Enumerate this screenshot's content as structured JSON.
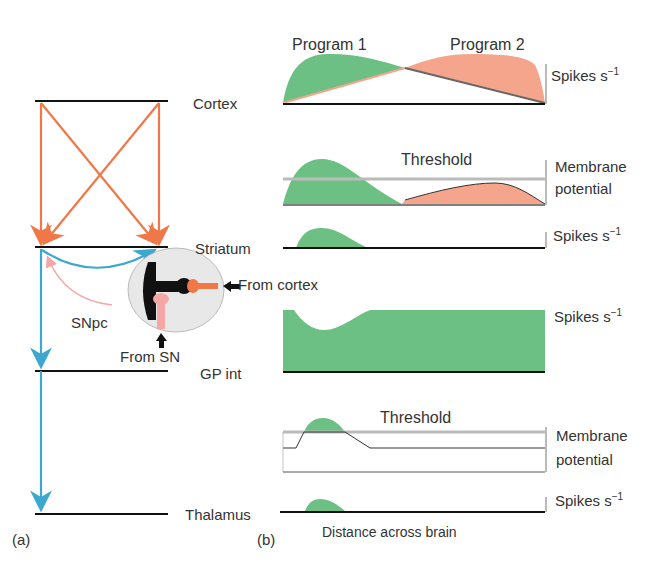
{
  "panel_a": {
    "label": "(a)",
    "levels": [
      "Cortex",
      "Striatum",
      "GP int",
      "Thalamus"
    ],
    "inset": {
      "from_cortex": "From cortex",
      "from_sn": "From SN",
      "snpc": "SNpc"
    }
  },
  "panel_b": {
    "label": "(b)",
    "program1": "Program 1",
    "program2": "Program 2",
    "threshold1": "Threshold",
    "threshold2": "Threshold",
    "axis_spikes": "Spikes s",
    "axis_sup": "−1",
    "axis_membrane_1": "Membrane",
    "axis_membrane_2": "potential",
    "xlabel": "Distance across brain"
  },
  "colors": {
    "green": "#6cc083",
    "salmon": "#f4a58c",
    "orange": "#f07848",
    "blue": "#3ba8cf",
    "pink": "#f4a7a6",
    "black": "#111111",
    "threshold": "#bbbbbb"
  }
}
